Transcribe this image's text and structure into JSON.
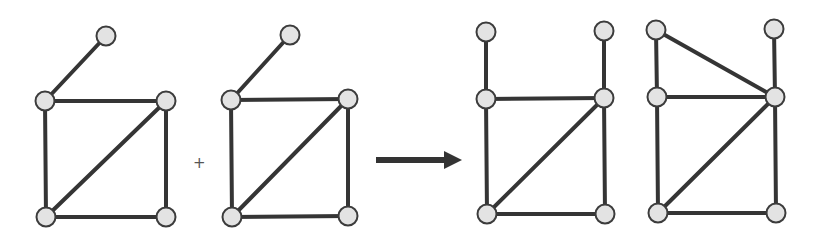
{
  "style": {
    "edge_color": "#353535",
    "edge_width": 4,
    "node_fill": "#e3e3e3",
    "node_stroke": "#3c3c3c",
    "node_radius": 9.5,
    "arrow_color": "#333333"
  },
  "operator": {
    "symbol": "+",
    "x": 193,
    "y": 170
  },
  "arrow": {
    "x1": 376,
    "x2": 462,
    "y": 160
  },
  "graphs": [
    {
      "id": "input-graph-1",
      "nodes": [
        [
          106,
          36
        ],
        [
          45,
          101
        ],
        [
          166,
          101
        ],
        [
          46,
          217
        ],
        [
          166,
          217
        ]
      ],
      "edges": [
        [
          0,
          1
        ],
        [
          1,
          2
        ],
        [
          1,
          3
        ],
        [
          2,
          4
        ],
        [
          3,
          4
        ],
        [
          3,
          2
        ]
      ]
    },
    {
      "id": "input-graph-2",
      "nodes": [
        [
          290,
          35
        ],
        [
          231,
          100
        ],
        [
          348,
          99
        ],
        [
          232,
          217
        ],
        [
          348,
          216
        ]
      ],
      "edges": [
        [
          0,
          1
        ],
        [
          1,
          2
        ],
        [
          1,
          3
        ],
        [
          2,
          4
        ],
        [
          3,
          4
        ],
        [
          3,
          2
        ]
      ]
    },
    {
      "id": "result-graph-1",
      "nodes": [
        [
          486,
          32
        ],
        [
          604,
          31
        ],
        [
          486,
          99
        ],
        [
          604,
          98
        ],
        [
          487,
          214
        ],
        [
          605,
          214
        ]
      ],
      "edges": [
        [
          0,
          2
        ],
        [
          1,
          3
        ],
        [
          2,
          3
        ],
        [
          2,
          4
        ],
        [
          3,
          5
        ],
        [
          4,
          5
        ],
        [
          4,
          3
        ]
      ]
    },
    {
      "id": "result-graph-2",
      "nodes": [
        [
          656,
          30
        ],
        [
          774,
          29
        ],
        [
          657,
          97
        ],
        [
          775,
          97
        ],
        [
          658,
          213
        ],
        [
          776,
          213
        ]
      ],
      "edges": [
        [
          0,
          2
        ],
        [
          0,
          3
        ],
        [
          1,
          3
        ],
        [
          2,
          3
        ],
        [
          2,
          4
        ],
        [
          3,
          5
        ],
        [
          4,
          5
        ],
        [
          4,
          3
        ]
      ]
    }
  ]
}
